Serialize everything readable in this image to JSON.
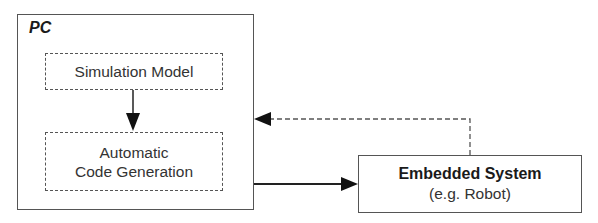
{
  "diagram": {
    "container": {
      "label": "PC"
    },
    "nodes": [
      {
        "id": "simulation-model",
        "label": "Simulation Model",
        "style": "dashed"
      },
      {
        "id": "code-generation",
        "lines": [
          "Automatic",
          "Code Generation"
        ],
        "style": "dashed"
      },
      {
        "id": "embedded-system",
        "title": "Embedded System",
        "subtitle": "(e.g. Robot)",
        "style": "solid"
      }
    ],
    "edges": [
      {
        "from": "simulation-model",
        "to": "code-generation",
        "style": "solid"
      },
      {
        "from": "code-generation",
        "to": "embedded-system",
        "style": "solid"
      },
      {
        "from": "embedded-system",
        "to": "PC",
        "style": "dashed"
      }
    ]
  },
  "colors": {
    "line": "#555555",
    "arrow": "#111111",
    "text": "#2a2a2a"
  }
}
